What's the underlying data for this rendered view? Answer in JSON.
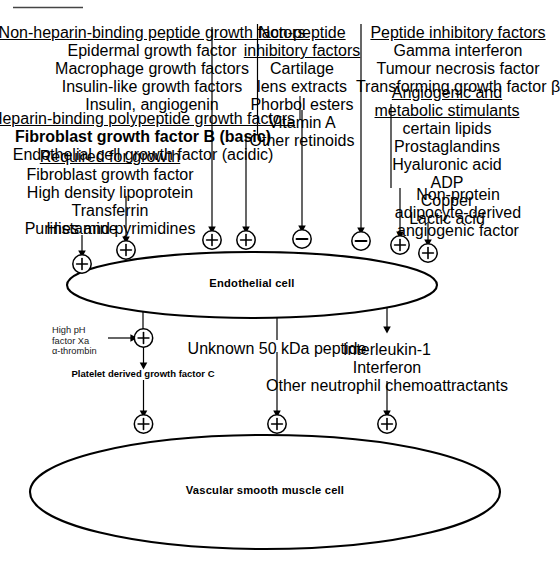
{
  "diagram": {
    "top_rule": "",
    "cells": {
      "endothelial": "Endothelial cell",
      "smooth_muscle": "Vascular smooth muscle cell"
    },
    "symbols": {
      "plus": "⊕",
      "minus": "⊖"
    },
    "groups": [
      {
        "id": "non-heparin-binding",
        "header": "Non-heparin-binding peptide growth factors",
        "items": [
          "Epidermal growth factor",
          "Macrophage growth factors",
          "Insulin-like growth factors",
          "Insulin, angiogenin"
        ],
        "effect": "plus"
      },
      {
        "id": "heparin-binding",
        "header": "Heparin-binding polypeptide growth factors",
        "items": [
          "Fibroblast growth factor B (basic)",
          "Endothelial cell growth factor (acidic)"
        ],
        "bold_items": [
          "Fibroblast growth factor B"
        ],
        "effect": "plus"
      },
      {
        "id": "required-for-growth",
        "header": "Required for growth",
        "items": [
          "Fibroblast growth factor",
          "High density lipoprotein",
          "Transferrin",
          "Purines and pyrimidines"
        ],
        "effect": "plus"
      },
      {
        "id": "histamine",
        "header": "",
        "items": [
          "Histamine"
        ],
        "effect": "plus"
      },
      {
        "id": "non-peptide-inhibitory",
        "header_line1": "Non-peptide",
        "header_line2": "inhibitory factors",
        "items": [
          "Cartilage",
          "lens extracts",
          "Phorbol esters",
          "Vitamin A",
          "Other retinoids"
        ],
        "effect": "minus"
      },
      {
        "id": "peptide-inhibitory",
        "header": "Peptide inhibitory factors",
        "items": [
          "Gamma interferon",
          "Tumour necrosis factor",
          "Transforming growth factor β"
        ],
        "effect": "minus"
      },
      {
        "id": "angiogenic-metabolic",
        "header_line1": "Angiogenic and",
        "header_line2": "metabolic stimulants",
        "items": [
          "certain lipids",
          "Prostaglandins",
          "Hyaluronic acid",
          "ADP",
          "Copper",
          "Lactic acid"
        ],
        "effect": "plus"
      },
      {
        "id": "adipocyte-derived",
        "header": "",
        "items": [
          "Non-protein",
          "adipocyte-derived",
          "angiogenic factor"
        ],
        "effect": "plus"
      }
    ],
    "outputs": [
      {
        "id": "pdgf-c",
        "activators": [
          "High pH",
          "factor Xa",
          "α-thrombin"
        ],
        "label": "Platelet derived growth factor C",
        "label_bold": true,
        "effect": "plus"
      },
      {
        "id": "unknown-50kda",
        "label": "Unknown 50 kDa peptide",
        "label_bold": false,
        "effect": "plus"
      },
      {
        "id": "neutrophil-chemoattractants",
        "lines": [
          "Interleukin-1",
          "Interferon",
          "Other neutrophil chemoattractants"
        ],
        "effect": "plus"
      }
    ],
    "colors": {
      "stroke": "#000000",
      "text": "#1a1a1a",
      "background": "#ffffff"
    }
  }
}
